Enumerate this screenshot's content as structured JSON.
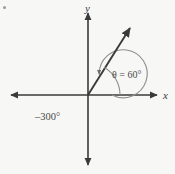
{
  "figure": {
    "background_color": "#f7f7f5",
    "ink_color": "#3a3a3a",
    "curve_color": "#8a8a8a",
    "axes": {
      "x_label": "x",
      "y_label": "y",
      "origin": {
        "x": 88,
        "y": 95
      },
      "x_extent": [
        8,
        160
      ],
      "y_extent": [
        10,
        168
      ],
      "arrowheads": [
        "left",
        "right",
        "up",
        "down"
      ]
    },
    "angles": [
      {
        "name": "positive-coterminal-angle",
        "label": "θ = 60°",
        "measure_degrees": 60,
        "direction": "counterclockwise",
        "arc_radius": 32,
        "label_position": {
          "x": 112,
          "y": 70
        }
      },
      {
        "name": "negative-coterminal-angle",
        "label": "–300°",
        "measure_degrees": -300,
        "direction": "clockwise",
        "arc_radius": 24,
        "label_position": {
          "x": 35,
          "y": 112
        }
      }
    ],
    "terminal_ray": {
      "name": "terminal-side",
      "angle_degrees": 60,
      "start": {
        "x": 88,
        "y": 95
      },
      "end": {
        "x": 133,
        "y": 24
      }
    },
    "corner_mark": "bullet-mark"
  }
}
